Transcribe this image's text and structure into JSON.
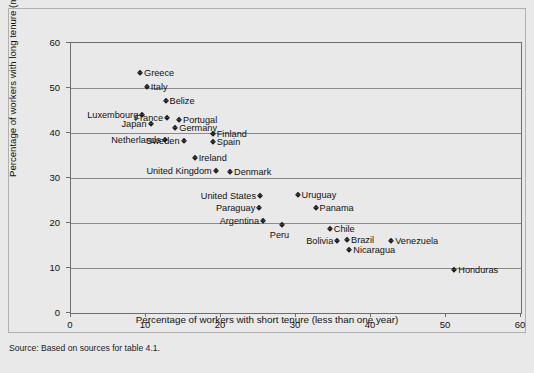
{
  "figure": {
    "source_note": "Source: Based on sources for table 4.1."
  },
  "chart_data": {
    "type": "scatter",
    "title": "",
    "xlabel": "Percentage of workers with short tenure (less than one year)",
    "ylabel": "Percentage of workers with long tenure (more than 10 years)",
    "xlim": [
      0,
      60
    ],
    "ylim": [
      0,
      60
    ],
    "xticks": [
      0,
      10,
      20,
      30,
      40,
      50,
      60
    ],
    "yticks": [
      0,
      10,
      20,
      30,
      40,
      50,
      60
    ],
    "grid": "horizontal",
    "legend": "none",
    "marker": "diamond",
    "marker_color": "#1a1a1a",
    "points": [
      {
        "label": "Greece",
        "x": 9.2,
        "y": 53.3,
        "side": "right"
      },
      {
        "label": "Italy",
        "x": 10.1,
        "y": 50.2,
        "side": "right"
      },
      {
        "label": "Belize",
        "x": 12.6,
        "y": 47.1,
        "side": "right"
      },
      {
        "label": "Luxembourg",
        "x": 9.5,
        "y": 44.0,
        "side": "left"
      },
      {
        "label": "France",
        "x": 12.8,
        "y": 43.3,
        "side": "left"
      },
      {
        "label": "Portugal",
        "x": 14.4,
        "y": 43.0,
        "side": "right"
      },
      {
        "label": "Japan",
        "x": 10.6,
        "y": 42.0,
        "side": "left"
      },
      {
        "label": "Germany",
        "x": 13.9,
        "y": 41.1,
        "side": "right"
      },
      {
        "label": "Finland",
        "x": 18.9,
        "y": 39.8,
        "side": "right"
      },
      {
        "label": "Netherlands",
        "x": 12.5,
        "y": 38.5,
        "side": "left"
      },
      {
        "label": "Sweden",
        "x": 15.0,
        "y": 38.3,
        "side": "left"
      },
      {
        "label": "Spain",
        "x": 18.9,
        "y": 38.0,
        "side": "right"
      },
      {
        "label": "Ireland",
        "x": 16.5,
        "y": 34.4,
        "side": "right"
      },
      {
        "label": "United Kingdom",
        "x": 19.3,
        "y": 31.6,
        "side": "left"
      },
      {
        "label": "Denmark",
        "x": 21.2,
        "y": 31.3,
        "side": "right"
      },
      {
        "label": "United States",
        "x": 25.2,
        "y": 26.0,
        "side": "left"
      },
      {
        "label": "Uruguay",
        "x": 30.2,
        "y": 26.2,
        "side": "right"
      },
      {
        "label": "Paraguay",
        "x": 25.1,
        "y": 23.3,
        "side": "left"
      },
      {
        "label": "Panama",
        "x": 32.6,
        "y": 23.3,
        "side": "right"
      },
      {
        "label": "Argentina",
        "x": 25.6,
        "y": 20.4,
        "side": "left"
      },
      {
        "label": "Peru",
        "x": 28.1,
        "y": 19.6,
        "side": "below"
      },
      {
        "label": "Chile",
        "x": 34.5,
        "y": 18.7,
        "side": "right"
      },
      {
        "label": "Brazil",
        "x": 36.8,
        "y": 16.2,
        "side": "right"
      },
      {
        "label": "Bolivia",
        "x": 35.5,
        "y": 16.0,
        "side": "left"
      },
      {
        "label": "Venezuela",
        "x": 42.7,
        "y": 16.0,
        "side": "right"
      },
      {
        "label": "Nicaragua",
        "x": 37.1,
        "y": 14.0,
        "side": "right"
      },
      {
        "label": "Honduras",
        "x": 51.1,
        "y": 9.6,
        "side": "right"
      }
    ]
  }
}
